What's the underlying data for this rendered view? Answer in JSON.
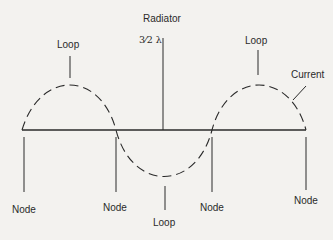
{
  "title": "Radiator",
  "radiator_length": "3⁄2 λ",
  "labels": {
    "current": "Current",
    "loops": [
      "Loop",
      "Loop",
      "Loop"
    ],
    "nodes": [
      "Node",
      "Node",
      "Node",
      "Node"
    ]
  },
  "colors": {
    "background": "#f3f2ef",
    "ink": "#2a2a2a"
  }
}
